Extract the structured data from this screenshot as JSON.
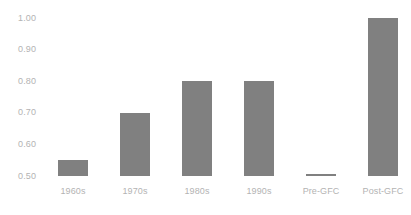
{
  "chart_data": {
    "type": "bar",
    "title": "",
    "subtitle": "",
    "xlabel": "",
    "ylabel": "",
    "categories": [
      "1960s",
      "1970s",
      "1980s",
      "1990s",
      "Pre-GFC",
      "Post-GFC"
    ],
    "values": [
      0.55,
      0.7,
      0.8,
      0.8,
      0.505,
      1.0
    ],
    "series": [
      {
        "name": "",
        "values": [
          0.55,
          0.7,
          0.8,
          0.8,
          0.505,
          1.0
        ]
      }
    ],
    "ylim": [
      0.5,
      1.0
    ],
    "yticks": [
      0.5,
      0.6,
      0.7,
      0.8,
      0.9,
      1.0
    ],
    "ytick_labels": [
      "0.50",
      "0.60",
      "0.70",
      "0.80",
      "0.90",
      "1.00"
    ],
    "grid": false,
    "legend": false,
    "legend_position": "none",
    "bar_color": "#808080",
    "text_color": "#b3b3b3",
    "background_color": "#ffffff",
    "annotations": []
  }
}
